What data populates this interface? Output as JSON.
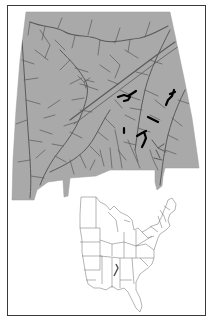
{
  "figure": {
    "type": "map",
    "main_map": {
      "region": "Alabama",
      "fill_color": "#a9a9a9",
      "stream_color": "#555555",
      "highlight_color": "#000000",
      "layers": [
        "stream network",
        "highlighted stream reaches"
      ],
      "highlighted_reaches_count": 6
    },
    "inset_map": {
      "region": "Eastern United States",
      "fill_color": "#ffffff",
      "boundary_color": "#666666",
      "highlight": "Alabama study area marked"
    },
    "frame": {
      "border_color": "#3a3a3a"
    }
  }
}
